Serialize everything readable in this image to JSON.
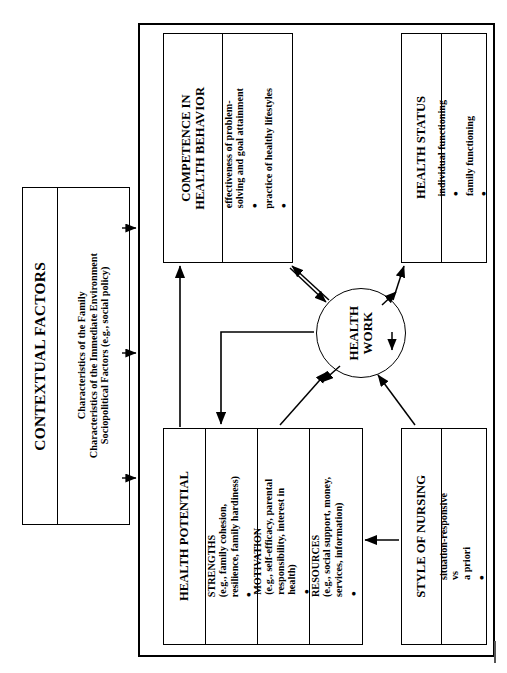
{
  "diagram": {
    "title_hidden": "Health work model",
    "contextual": {
      "title": "CONTEXTUAL FACTORS",
      "lines": "Characteristics of the Family\nCharacteristics of the Immediate Environment\nSociopolitical Factors (e.g., social policy)"
    },
    "center": {
      "label": "HEALTH\nWORK"
    },
    "boxes": [
      {
        "id": "competence",
        "header": "COMPETENCE IN\nHEALTH BEHAVIOR",
        "items": [
          {
            "bullet": "•",
            "text": "effectiveness of problem-\nsolving and goal attainment"
          },
          {
            "bullet": "•",
            "text": "practice of healthy lifestyles"
          }
        ]
      },
      {
        "id": "status",
        "header": "HEALTH STATUS",
        "items": [
          {
            "bullet": "•",
            "text": "individual functioning"
          },
          {
            "bullet": "•",
            "text": "family functioning"
          }
        ]
      },
      {
        "id": "potential",
        "header": "HEALTH POTENTIAL",
        "items": [
          {
            "bullet": "•",
            "text": "STRENGTHS\n(e.g., family cohesion,\nresilience, family hardiness)"
          },
          {
            "bullet": "•",
            "text": "MOTIVATION\n(e.g., self-efficacy, parental\nresponsibility, interest in\nhealth)"
          },
          {
            "bullet": "•",
            "text": "RESOURCES\n(e.g., social support, money,\nservices, information)"
          }
        ]
      },
      {
        "id": "nursing",
        "header": "STYLE OF NURSING",
        "items": [
          {
            "bullet": "•",
            "text": "situation-responsive\nvs\na priori"
          }
        ]
      }
    ],
    "colors": {
      "line": "#000000",
      "background": "#ffffff"
    }
  }
}
